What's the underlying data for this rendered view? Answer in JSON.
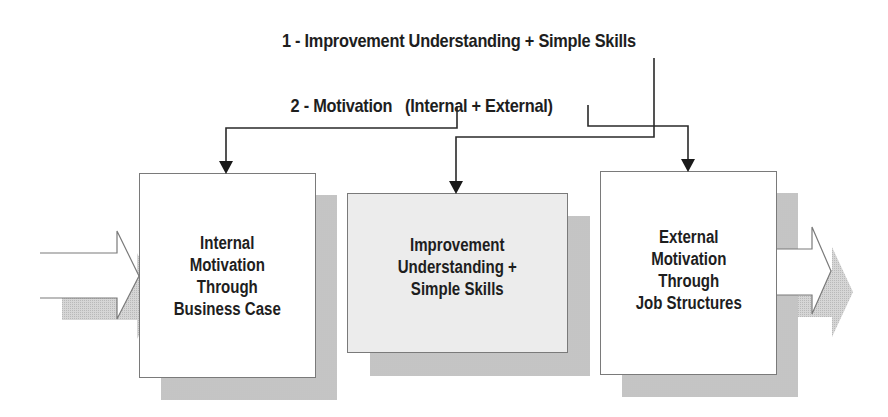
{
  "legend": {
    "item1": "1 - Improvement Understanding + Simple Skills",
    "item2_label": "2 - Motivation",
    "item2_detail": "(Internal + External)"
  },
  "boxes": [
    {
      "id": "internal",
      "lines": [
        "Internal",
        "Motivation",
        "Through",
        "Business Case"
      ]
    },
    {
      "id": "improvement",
      "lines": [
        "Improvement",
        "Understanding +",
        "Simple Skills"
      ]
    },
    {
      "id": "external",
      "lines": [
        "External",
        "Motivation",
        "Through",
        "Job Structures"
      ]
    }
  ],
  "colors": {
    "text": "#1e1e1e",
    "box_border": "#7a7a7a",
    "shadow": "#cfcfcf",
    "middle_box_fill": "#ececec",
    "connector": "#1e1e1e"
  },
  "connectors": [
    {
      "from": "legend-item-2",
      "to": "internal"
    },
    {
      "from": "legend-item-1",
      "to": "improvement"
    },
    {
      "from": "legend-item-2",
      "to": "external"
    }
  ],
  "flow": {
    "input_arrow": "into internal",
    "output_arrow": "out of external"
  }
}
